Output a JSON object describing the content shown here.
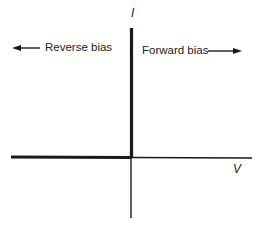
{
  "diagram": {
    "type": "diode I-V characteristic (ideal)",
    "axes": {
      "y_label": "I",
      "x_label": "V"
    },
    "annotations": {
      "reverse_bias": "Reverse bias",
      "forward_bias": "Forward bias"
    },
    "colors": {
      "line": "#1a1a1a",
      "background": "#ffffff"
    }
  }
}
